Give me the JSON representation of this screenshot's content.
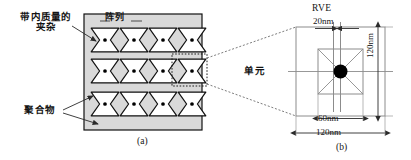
{
  "figure": {
    "panel_a": {
      "caption": "(a)",
      "label_inclusion": "带内质量的\n夹杂",
      "label_inclusion_line1": "带内质量的",
      "label_inclusion_line2": "夹杂",
      "label_array": "阵列",
      "label_polymer": "聚合物",
      "grid": {
        "columns": 4,
        "rows": 3
      },
      "colors": {
        "matrix_fill": "#d9d9d9",
        "inclusion_fill": "#ffffff",
        "outline": "#111111",
        "mass_dot": "#000000",
        "selection_box": "#222222"
      }
    },
    "panel_b": {
      "caption": "(b)",
      "label_rve": "RVE",
      "label_unit": "单元",
      "dim_channel_width": "20nm",
      "dim_inner_width": "60nm",
      "dim_outer_width": "120nm",
      "dim_outer_height": "120nm",
      "colors": {
        "construction_line": "#8c8c8c",
        "dimension_line": "#333333",
        "mass_dot": "#000000",
        "connector": "#777777"
      }
    }
  }
}
